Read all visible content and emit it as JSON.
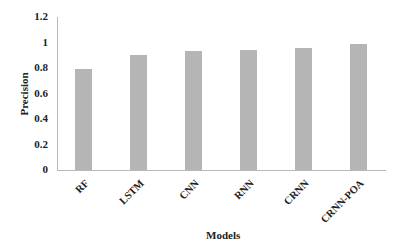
{
  "chart_data": {
    "type": "bar",
    "title": "",
    "xlabel": "Models",
    "ylabel": "Precision",
    "categories": [
      "RF",
      "LSTM",
      "CNN",
      "RNN",
      "CRNN",
      "CRNN-POA"
    ],
    "values": [
      0.79,
      0.9,
      0.93,
      0.94,
      0.96,
      0.99
    ],
    "ylim": [
      0,
      1.2
    ],
    "yticks": [
      "0",
      "0.2",
      "0.4",
      "0.6",
      "0.8",
      "1",
      "1.2"
    ],
    "grid": false,
    "legend": null,
    "bar_color": "#b5b5b5"
  }
}
